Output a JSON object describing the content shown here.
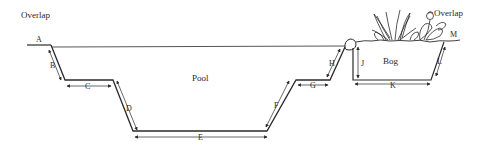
{
  "diagram": {
    "type": "pool-and-bog-cross-section",
    "labels": {
      "overlap_left": "Overlap",
      "overlap_right": "Overlap",
      "pool": "Pool",
      "bog": "Bog",
      "A": "A",
      "B": "B",
      "C": "C",
      "D": "D",
      "E": "E",
      "F": "F",
      "G": "G",
      "H": "H",
      "J": "J",
      "K": "K",
      "L": "L",
      "M": "M"
    },
    "colors": {
      "ink": "#2a2a2a",
      "background": "#ffffff"
    }
  }
}
